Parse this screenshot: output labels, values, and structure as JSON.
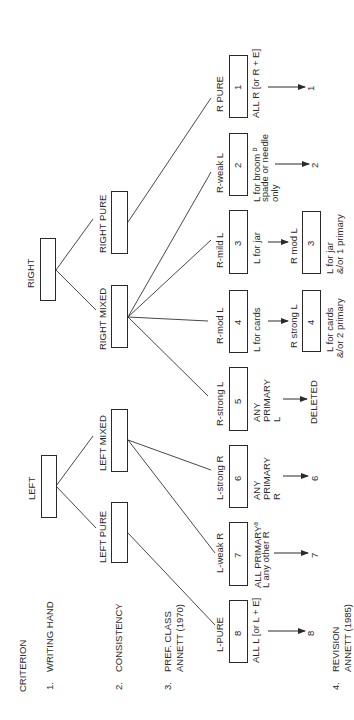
{
  "criteria": {
    "header": "CRITERION",
    "items": [
      {
        "number": "1.",
        "label": "WRITING HAND"
      },
      {
        "number": "2.",
        "label": "CONSISTENCY"
      },
      {
        "number": "3.",
        "label": "PREF. CLASS",
        "sublabel": "ANNETT (1970)"
      },
      {
        "number": "4.",
        "label": "REVISION",
        "sublabel": "ANNETT (1985)"
      }
    ]
  },
  "level1": {
    "right": "RIGHT",
    "left": "LEFT"
  },
  "level2": {
    "right_pure": "RIGHT PURE",
    "right_mixed": "RIGHT MIXED",
    "left_mixed": "LEFT MIXED",
    "left_pure": "LEFT PURE"
  },
  "level3": [
    {
      "num": "1",
      "name": "R PURE",
      "desc": [
        "ALL R [or R + E]"
      ],
      "result": "1"
    },
    {
      "num": "2",
      "name": "R-weak L",
      "desc": [
        "L for broom",
        "spade or needle",
        "only"
      ],
      "footnote": "b",
      "result": "2"
    },
    {
      "num": "3",
      "name": "R-mild L",
      "desc": [
        "L for jar"
      ]
    },
    {
      "num": "4",
      "name": "R-mod L",
      "desc": [
        "L for cards"
      ]
    },
    {
      "num": "5",
      "name": "R-strong L",
      "desc": [
        "ANY",
        "PRIMARY",
        "L"
      ],
      "result": "DELETED"
    },
    {
      "num": "6",
      "name": "L-strong R",
      "desc": [
        "ANY",
        "PRIMARY",
        "R"
      ],
      "result": "6"
    },
    {
      "num": "7",
      "name": "L-weak R",
      "desc": [
        "ALL PRIMARY",
        "L any other R"
      ],
      "footnote": "a",
      "result": "7"
    },
    {
      "num": "8",
      "name": "L-PURE",
      "desc": [
        "ALL L [or L + E]"
      ],
      "result": "8"
    }
  ],
  "level4": [
    {
      "num": "3",
      "name": "R mod L",
      "desc": [
        "L for jar",
        "&/or 1 primary"
      ]
    },
    {
      "num": "4",
      "name": "R strong L",
      "desc": [
        "L for cards",
        "&/or 2 primary"
      ]
    }
  ]
}
